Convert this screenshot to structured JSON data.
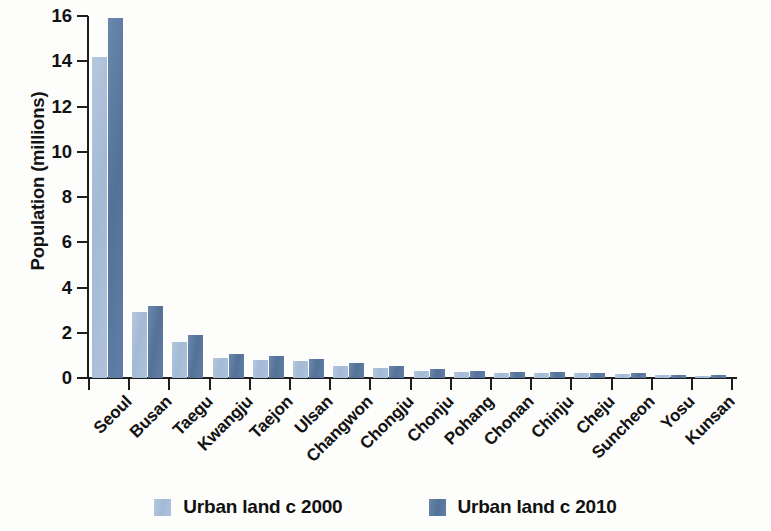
{
  "chart_data": {
    "type": "bar",
    "title": "",
    "xlabel": "",
    "ylabel": "Population (millions)",
    "ylim": [
      0,
      16
    ],
    "yticks": [
      0,
      2,
      4,
      6,
      8,
      10,
      12,
      14,
      16
    ],
    "ytick_labels": [
      "0",
      "2",
      "4",
      "6",
      "8",
      "10",
      "12",
      "14",
      "16"
    ],
    "grid": false,
    "legend_position": "bottom-center",
    "categories": [
      "Seoul",
      "Busan",
      "Taegu",
      "Kwangju",
      "Taejon",
      "Ulsan",
      "Changwon",
      "Chongju",
      "Chonju",
      "Pohang",
      "Chonan",
      "Chinju",
      "Cheju",
      "Suncheon",
      "Yosu",
      "Kunsan"
    ],
    "series": [
      {
        "name": "Urban land c 2000",
        "color": "#a9bed8",
        "values": [
          14.2,
          2.9,
          1.6,
          0.9,
          0.8,
          0.75,
          0.55,
          0.45,
          0.3,
          0.28,
          0.22,
          0.22,
          0.2,
          0.17,
          0.12,
          0.1
        ]
      },
      {
        "name": "Urban land c 2010",
        "color": "#5a7aa3",
        "values": [
          15.9,
          3.2,
          1.9,
          1.05,
          0.98,
          0.85,
          0.65,
          0.55,
          0.4,
          0.32,
          0.26,
          0.26,
          0.24,
          0.21,
          0.15,
          0.12
        ]
      }
    ]
  },
  "legend": {
    "entries": [
      {
        "label": "Urban land c 2000",
        "color": "#a9bed8"
      },
      {
        "label": "Urban land c 2010",
        "color": "#5a7aa3"
      }
    ]
  }
}
